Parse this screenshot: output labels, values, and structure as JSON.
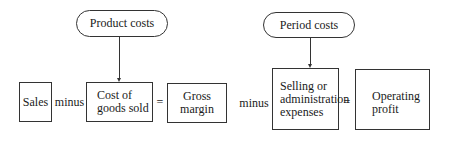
{
  "diagram": {
    "type": "flowchart",
    "sources": [
      {
        "id": "product_costs",
        "label": "Product costs",
        "points_to": "cost_of_goods_sold"
      },
      {
        "id": "period_costs",
        "label": "Period costs",
        "points_to": "selling_admin"
      }
    ],
    "boxes": [
      {
        "id": "sales",
        "label": "Sales"
      },
      {
        "id": "cost_of_goods_sold",
        "line1": "Cost of",
        "line2": "goods sold"
      },
      {
        "id": "gross_margin",
        "line1": "Gross",
        "line2": "margin"
      },
      {
        "id": "selling_admin",
        "line1": "Selling or",
        "line2": "administration",
        "line3": "expenses"
      },
      {
        "id": "operating_profit",
        "line1": "Operating",
        "line2": "profit"
      }
    ],
    "operators": {
      "minus1": "minus",
      "equals1": "=",
      "minus2": "minus",
      "equals2": "="
    }
  }
}
